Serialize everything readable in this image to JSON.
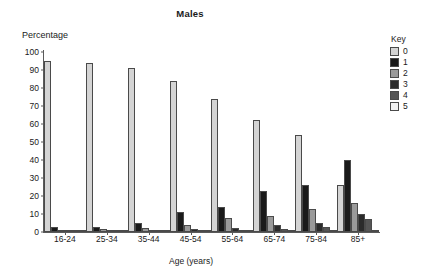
{
  "chart_data": {
    "type": "bar",
    "title": "Males",
    "xlabel": "Age (years)",
    "ylabel": "Percentage",
    "ylim": [
      0,
      100
    ],
    "yticks": [
      0,
      10,
      20,
      30,
      40,
      50,
      60,
      70,
      80,
      90,
      100
    ],
    "grid": false,
    "legend_title": "Key",
    "legend_position": "right",
    "categories": [
      "16-24",
      "25-34",
      "35-44",
      "45-54",
      "55-64",
      "65-74",
      "75-84",
      "85+"
    ],
    "series": [
      {
        "name": "0",
        "color": "#d4d4d4",
        "values": [
          95,
          94,
          91,
          84,
          74,
          62,
          54,
          26
        ]
      },
      {
        "name": "1",
        "color": "#1a1a1a",
        "values": [
          3,
          3,
          5,
          11,
          14,
          23,
          26,
          40
        ]
      },
      {
        "name": "2",
        "color": "#9a9a9a",
        "values": [
          1,
          1.5,
          2.5,
          4,
          8,
          9,
          13,
          16
        ]
      },
      {
        "name": "3",
        "color": "#2b2b2b",
        "values": [
          0.4,
          0.5,
          1,
          1.5,
          2.5,
          4,
          5,
          10
        ]
      },
      {
        "name": "4",
        "color": "#555555",
        "values": [
          0.2,
          0.3,
          0.5,
          0.8,
          1.2,
          1.5,
          3,
          7
        ]
      },
      {
        "name": "5",
        "color": "#f2f2f2",
        "values": [
          0.1,
          0.1,
          0.2,
          0.3,
          0.4,
          0.6,
          0.8,
          1
        ]
      }
    ]
  }
}
